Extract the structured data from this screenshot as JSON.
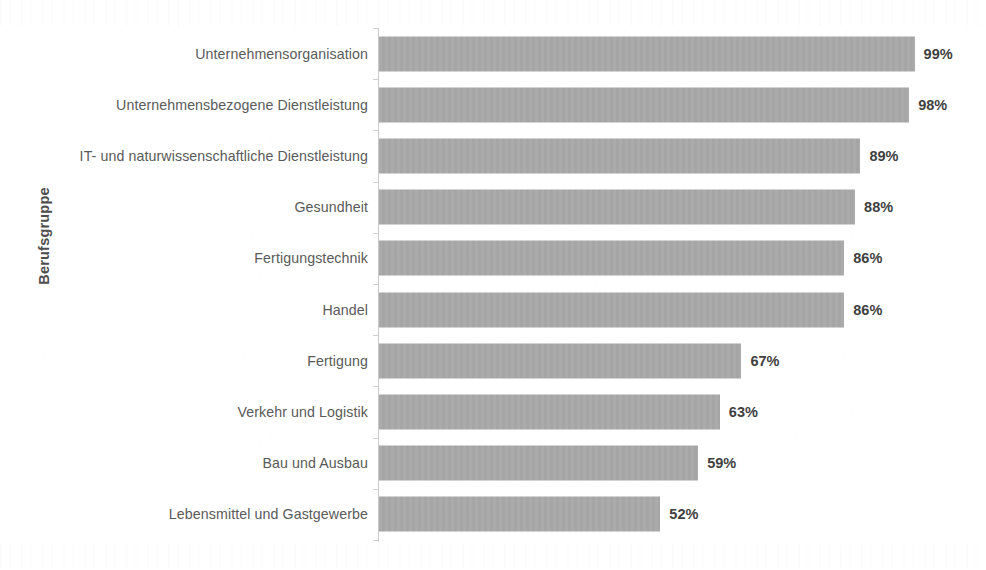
{
  "chart_data": {
    "type": "bar",
    "orientation": "horizontal",
    "title": "",
    "xlabel": "",
    "ylabel": "Berufsgruppe",
    "xlim": [
      0,
      100
    ],
    "grid": false,
    "legend": null,
    "value_suffix": "%",
    "categories": [
      "Unternehmensorganisation",
      "Unternehmensbezogene Dienstleistung",
      "IT- und naturwissenschaftliche Dienstleistung",
      "Gesundheit",
      "Fertigungstechnik",
      "Handel",
      "Fertigung",
      "Verkehr und Logistik",
      "Bau und Ausbau",
      "Lebensmittel und Gastgewerbe"
    ],
    "values": [
      99,
      98,
      89,
      88,
      86,
      86,
      67,
      63,
      59,
      52
    ],
    "value_labels": [
      "99%",
      "98%",
      "89%",
      "88%",
      "86%",
      "86%",
      "67%",
      "63%",
      "59%",
      "52%"
    ]
  },
  "style": {
    "bar_color": "#a8a8a8",
    "axis_color": "#c9c9c9",
    "category_label_color": "#5a5a5a",
    "value_label_color": "#3f3f3f",
    "axis_title_color": "#4d4d4d",
    "background": "#ffffff"
  }
}
